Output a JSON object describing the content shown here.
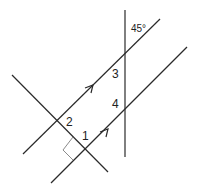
{
  "diagram": {
    "labels": {
      "angle_given": "45°",
      "angle_1": "1",
      "angle_2": "2",
      "angle_3": "3",
      "angle_4": "4"
    },
    "elements": {
      "upper_parallel_line": {
        "x1": 23,
        "y1": 154,
        "x2": 160,
        "y2": 19,
        "arrow": true
      },
      "lower_parallel_line": {
        "x1": 51,
        "y1": 183,
        "x2": 187,
        "y2": 47,
        "arrow": true
      },
      "vertical_transversal": {
        "x1": 125,
        "y1": 10,
        "x2": 125,
        "y2": 157
      },
      "perpendicular_transversal": {
        "x1": 12,
        "y1": 75,
        "x2": 108,
        "y2": 172
      },
      "right_angle_marker": {
        "at": [
          86,
          150
        ]
      }
    },
    "colors": {
      "line": "#2a2a2a",
      "right_angle": "#8a8a8a",
      "background": "#ffffff"
    }
  }
}
